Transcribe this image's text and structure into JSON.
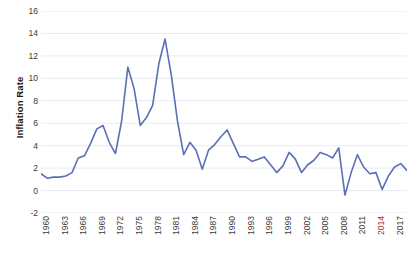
{
  "chart_data": {
    "type": "line",
    "title": "",
    "subtitle": "",
    "xlabel": "",
    "ylabel": "Inflation Rate",
    "grid": true,
    "grid_orientation": "horizontal",
    "legend": false,
    "legend_position": "none",
    "line_color": "#5B6FB5",
    "line_width": 1.6,
    "markers": false,
    "xlim": [
      1960,
      2019
    ],
    "ylim": [
      -2,
      16
    ],
    "yticks": [
      -2,
      0,
      2,
      4,
      6,
      8,
      10,
      12,
      14,
      16
    ],
    "ytick_labels": [
      "-2",
      "0",
      "2",
      "4",
      "6",
      "8",
      "10",
      "12",
      "14",
      "16"
    ],
    "xtick_step": 3,
    "xticks": [
      1960,
      1963,
      1966,
      1969,
      1972,
      1975,
      1978,
      1981,
      1984,
      1987,
      1990,
      1993,
      1996,
      1999,
      2002,
      2005,
      2008,
      2011,
      2014,
      2017
    ],
    "xtick_labels": [
      "1960",
      "1963",
      "1966",
      "1969",
      "1972",
      "1975",
      "1978",
      "1981",
      "1984",
      "1987",
      "1990",
      "1993",
      "1996",
      "1999",
      "2002",
      "2005",
      "2008",
      "2011",
      "2014",
      "2017"
    ],
    "xtick_highlight": [
      "2014"
    ],
    "xtick_highlight_color": "#b02a2a",
    "xtick_rotation": -90,
    "x": [
      1960,
      1961,
      1962,
      1963,
      1964,
      1965,
      1966,
      1967,
      1968,
      1969,
      1970,
      1971,
      1972,
      1973,
      1974,
      1975,
      1976,
      1977,
      1978,
      1979,
      1980,
      1981,
      1982,
      1983,
      1984,
      1985,
      1986,
      1987,
      1988,
      1989,
      1990,
      1991,
      1992,
      1993,
      1994,
      1995,
      1996,
      1997,
      1998,
      1999,
      2000,
      2001,
      2002,
      2003,
      2004,
      2005,
      2006,
      2007,
      2008,
      2009,
      2010,
      2011,
      2012,
      2013,
      2014,
      2015,
      2016,
      2017,
      2018,
      2019
    ],
    "series": [
      {
        "name": "Inflation Rate",
        "color": "#5B6FB5",
        "values": [
          1.5,
          1.1,
          1.2,
          1.2,
          1.3,
          1.6,
          2.9,
          3.1,
          4.2,
          5.5,
          5.8,
          4.3,
          3.3,
          6.2,
          11.0,
          9.1,
          5.8,
          6.5,
          7.6,
          11.3,
          13.5,
          10.3,
          6.2,
          3.2,
          4.3,
          3.6,
          1.9,
          3.6,
          4.1,
          4.8,
          5.4,
          4.2,
          3.0,
          3.0,
          2.6,
          2.8,
          3.0,
          2.3,
          1.6,
          2.2,
          3.4,
          2.8,
          1.6,
          2.3,
          2.7,
          3.4,
          3.2,
          2.9,
          3.8,
          -0.4,
          1.6,
          3.2,
          2.1,
          1.5,
          1.6,
          0.1,
          1.3,
          2.1,
          2.4,
          1.8
        ]
      }
    ],
    "annotations": [],
    "notable_points": [
      {
        "year": 1980,
        "value": 13.5,
        "label": "peak"
      },
      {
        "year": 1974,
        "value": 11.0,
        "label": "peak"
      },
      {
        "year": 1979,
        "value": 11.3,
        "label": "peak"
      },
      {
        "year": 2009,
        "value": -0.4,
        "label": "trough"
      },
      {
        "year": 2015,
        "value": 0.1,
        "label": "trough"
      },
      {
        "year": 1961,
        "value": 1.1,
        "label": "trough"
      }
    ]
  },
  "axes": {
    "y_title": "Inflation Rate"
  }
}
